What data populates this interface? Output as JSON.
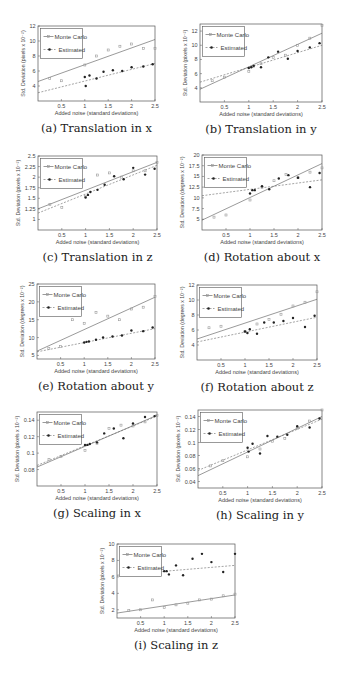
{
  "figure": {
    "legend": {
      "monte_carlo": "Monte Carlo",
      "estimated": "Estimated"
    },
    "xlabel": "Added noise (standard deviations)",
    "colors": {
      "axis": "#555555",
      "monte_carlo": "#9a9a9a",
      "estimated": "#222222",
      "background": "#ffffff"
    }
  },
  "chart_data": [
    {
      "id": "a",
      "caption": "(a) Translation in x",
      "type": "scatter",
      "xlabel": "Added noise (standard deviations)",
      "ylabel": "Std. Deviation (pixels x 10^-2)",
      "xlim": [
        0,
        2.5
      ],
      "ylim": [
        2,
        12
      ],
      "xticks": [
        0.5,
        1,
        1.5,
        2,
        2.5
      ],
      "xticklabels": [
        "0.5",
        "1",
        "1.5",
        "2",
        "2.5"
      ],
      "yticks": [
        4,
        6,
        8,
        10,
        12
      ],
      "yticklabels": [
        "4",
        "6",
        "8",
        "10",
        "12"
      ],
      "frame": {
        "x": 38,
        "y": 26,
        "w": 117,
        "h": 75
      },
      "series": [
        {
          "name": "Monte Carlo",
          "x": [
            0.25,
            0.5,
            1.0,
            1.25,
            1.5,
            1.75,
            2.0,
            2.25,
            2.5
          ],
          "y": [
            5.0,
            4.7,
            6.8,
            8.0,
            8.8,
            9.3,
            9.6,
            9.0,
            9.0
          ],
          "fit": [
            4.6,
            10.2
          ]
        },
        {
          "name": "Estimated",
          "x": [
            1.0,
            1.02,
            1.1,
            1.25,
            1.4,
            1.6,
            1.8,
            2.0,
            2.25,
            2.45
          ],
          "y": [
            5.2,
            4.0,
            5.4,
            5.0,
            5.9,
            6.1,
            6.0,
            6.5,
            6.6,
            6.9
          ],
          "fit": [
            3.1,
            7.0
          ]
        }
      ]
    },
    {
      "id": "b",
      "caption": "(b) Translation in y",
      "type": "scatter",
      "xlabel": "Added noise (standard deviations)",
      "ylabel": "Std. Deviation (pixels x 10^-2)",
      "xlim": [
        0,
        2.5
      ],
      "ylim": [
        2,
        13
      ],
      "xticks": [
        0.5,
        1,
        1.5,
        2,
        2.5
      ],
      "xticklabels": [
        "0.5",
        "1",
        "1.5",
        "2",
        "2.5"
      ],
      "yticks": [
        4,
        6,
        8,
        10,
        12
      ],
      "yticklabels": [
        "4",
        "6",
        "8",
        "10",
        "12"
      ],
      "frame": {
        "x": 200,
        "y": 24,
        "w": 122,
        "h": 78
      },
      "series": [
        {
          "name": "Monte Carlo",
          "x": [
            0.25,
            0.5,
            1.0,
            1.1,
            1.25,
            1.5,
            1.75,
            2.0,
            2.25,
            2.5
          ],
          "y": [
            5.0,
            5.5,
            6.3,
            7.0,
            7.4,
            8.3,
            8.6,
            10.0,
            11.0,
            12.8
          ],
          "fit": [
            3.8,
            11.7
          ]
        },
        {
          "name": "Estimated",
          "x": [
            1.0,
            1.05,
            1.1,
            1.25,
            1.4,
            1.6,
            1.8,
            2.0,
            2.25,
            2.45
          ],
          "y": [
            6.8,
            6.9,
            7.1,
            6.9,
            8.3,
            9.1,
            8.1,
            9.2,
            9.7,
            10.3
          ],
          "fit": [
            4.8,
            10.0
          ]
        }
      ]
    },
    {
      "id": "c",
      "caption": "(c) Translation in z",
      "type": "scatter",
      "xlabel": "Added noise (standard deviations)",
      "ylabel": "Std. Deviation (pixels x 10^-2)",
      "xlim": [
        0,
        2.5
      ],
      "ylim": [
        0.75,
        2.5
      ],
      "xticks": [
        0.5,
        1,
        1.5,
        2,
        2.5
      ],
      "xticklabels": [
        "0.5",
        "1",
        "1.5",
        "2",
        "2.5"
      ],
      "yticks": [
        1,
        1.25,
        1.5,
        1.75,
        2,
        2.25,
        2.5
      ],
      "yticklabels": [
        "1",
        "1.25",
        "1.5",
        "1.75",
        "2",
        "2.25",
        "2.5"
      ],
      "frame": {
        "x": 38,
        "y": 156,
        "w": 119,
        "h": 74
      },
      "series": [
        {
          "name": "Monte Carlo",
          "x": [
            0.25,
            0.5,
            1.0,
            1.25,
            1.5,
            1.75,
            2.0,
            2.25,
            2.5
          ],
          "y": [
            1.35,
            1.28,
            1.55,
            2.05,
            2.1,
            2.0,
            2.15,
            2.15,
            2.35
          ],
          "fit": [
            1.25,
            2.35
          ]
        },
        {
          "name": "Estimated",
          "x": [
            1.0,
            1.05,
            1.1,
            1.25,
            1.4,
            1.6,
            1.8,
            2.0,
            2.25,
            2.45
          ],
          "y": [
            1.52,
            1.58,
            1.65,
            1.7,
            1.82,
            2.02,
            1.95,
            2.22,
            2.06,
            2.2
          ],
          "fit": [
            1.15,
            2.28
          ]
        }
      ]
    },
    {
      "id": "d",
      "caption": "(d) Rotation about x",
      "type": "scatter",
      "xlabel": "Added noise (standard deviations)",
      "ylabel": "Std. Deviation (degrees x 10^-2)",
      "xlim": [
        0,
        2.5
      ],
      "ylim": [
        2.5,
        20
      ],
      "xticks": [
        0.5,
        1,
        1.5,
        2,
        2.5
      ],
      "xticklabels": [
        "0.5",
        "1",
        "1.5",
        "2",
        "2.5"
      ],
      "yticks": [
        5,
        7.5,
        10,
        12.5,
        15,
        17.5,
        20
      ],
      "yticklabels": [
        "5",
        "7.5",
        "10",
        "12.5",
        "15",
        "17.5",
        "20"
      ],
      "frame": {
        "x": 202,
        "y": 155,
        "w": 120,
        "h": 75
      },
      "series": [
        {
          "name": "Monte Carlo",
          "x": [
            0.25,
            0.5,
            1.0,
            1.25,
            1.5,
            1.75,
            2.0,
            2.25,
            2.5
          ],
          "y": [
            5.5,
            6.0,
            9.5,
            12.5,
            14.0,
            15.5,
            14.7,
            16.0,
            17.0
          ],
          "fit": [
            4.8,
            18.0
          ]
        },
        {
          "name": "Estimated",
          "x": [
            1.0,
            1.05,
            1.1,
            1.25,
            1.4,
            1.6,
            1.8,
            2.0,
            2.25,
            2.45
          ],
          "y": [
            11.0,
            11.8,
            11.8,
            12.7,
            12.0,
            14.5,
            15.3,
            14.7,
            12.5,
            15.8
          ],
          "fit": [
            10.5,
            14.2
          ]
        }
      ]
    },
    {
      "id": "e",
      "caption": "(e) Rotation about y",
      "type": "scatter",
      "xlabel": "Added noise (standard deviations)",
      "ylabel": "Std. Deviation (degrees x 10^-2)",
      "xlim": [
        0,
        2.5
      ],
      "ylim": [
        4,
        25
      ],
      "xticks": [
        0.5,
        1,
        1.5,
        2,
        2.5
      ],
      "xticklabels": [
        "0.5",
        "1",
        "1.5",
        "2",
        "2.5"
      ],
      "yticks": [
        5,
        10,
        15,
        20,
        25
      ],
      "yticklabels": [
        "5",
        "10",
        "15",
        "20",
        "25"
      ],
      "frame": {
        "x": 37,
        "y": 284,
        "w": 118,
        "h": 75
      },
      "series": [
        {
          "name": "Monte Carlo",
          "x": [
            0.25,
            0.5,
            0.75,
            1.0,
            1.25,
            1.5,
            1.75,
            2.0,
            2.25,
            2.5
          ],
          "y": [
            7.0,
            7.5,
            15.0,
            14.0,
            17.0,
            16.0,
            15.0,
            18.0,
            18.5,
            21.5
          ],
          "fit": [
            6.2,
            21.3
          ]
        },
        {
          "name": "Estimated",
          "x": [
            1.0,
            1.05,
            1.1,
            1.25,
            1.4,
            1.6,
            1.8,
            2.0,
            2.25,
            2.45
          ],
          "y": [
            8.6,
            8.8,
            8.9,
            9.4,
            10.0,
            10.3,
            10.6,
            12.0,
            11.8,
            12.8
          ],
          "fit": [
            6.0,
            12.5
          ]
        }
      ]
    },
    {
      "id": "f",
      "caption": "(f) Rotation about z",
      "type": "scatter",
      "xlabel": "Added noise (standard deviations)",
      "ylabel": "Std. Deviation (degrees x 10^-2)",
      "xlim": [
        0,
        2.5
      ],
      "ylim": [
        2,
        12
      ],
      "xticks": [
        0.5,
        1,
        1.5,
        2,
        2.5
      ],
      "xticklabels": [
        "0.5",
        "1",
        "1.5",
        "2",
        "2.5"
      ],
      "yticks": [
        4,
        6,
        8,
        10,
        12
      ],
      "yticklabels": [
        "4",
        "6",
        "8",
        "10",
        "12"
      ],
      "frame": {
        "x": 197,
        "y": 285,
        "w": 120,
        "h": 75
      },
      "series": [
        {
          "name": "Monte Carlo",
          "x": [
            0.25,
            0.5,
            0.75,
            1.0,
            1.25,
            1.5,
            1.75,
            2.0,
            2.25,
            2.5
          ],
          "y": [
            6.3,
            6.5,
            8.1,
            5.8,
            6.8,
            7.4,
            8.1,
            9.2,
            9.7,
            11.1
          ],
          "fit": [
            4.8,
            10.1
          ]
        },
        {
          "name": "Estimated",
          "x": [
            1.0,
            1.05,
            1.1,
            1.25,
            1.4,
            1.6,
            1.8,
            2.0,
            2.25,
            2.45
          ],
          "y": [
            5.8,
            5.6,
            6.1,
            5.5,
            7.0,
            7.0,
            7.2,
            7.6,
            6.4,
            7.9
          ],
          "fit": [
            4.4,
            7.7
          ]
        }
      ]
    },
    {
      "id": "g",
      "caption": "(g) Scaling in x",
      "type": "scatter",
      "xlabel": "Added noise (standard deviations)",
      "ylabel": "Std. Deviation (pixels x 10^-2)",
      "xlim": [
        0,
        2.5
      ],
      "ylim": [
        0.06,
        0.15
      ],
      "xticks": [
        0.5,
        1,
        1.5,
        2,
        2.5
      ],
      "xticklabels": [
        "0.5",
        "1",
        "1.5",
        "2",
        "2.5"
      ],
      "yticks": [
        0.08,
        0.1,
        0.12,
        0.14
      ],
      "yticklabels": [
        "0.08",
        "0.1",
        "0.12",
        "0.14"
      ],
      "frame": {
        "x": 37,
        "y": 412,
        "w": 120,
        "h": 74
      },
      "series": [
        {
          "name": "Monte Carlo",
          "x": [
            0.25,
            0.5,
            1.0,
            1.25,
            1.5,
            1.75,
            2.0,
            2.25,
            2.5
          ],
          "y": [
            0.092,
            0.096,
            0.103,
            0.112,
            0.13,
            0.134,
            0.133,
            0.138,
            0.146
          ],
          "fit": [
            0.083,
            0.146
          ]
        },
        {
          "name": "Estimated",
          "x": [
            1.0,
            1.05,
            1.1,
            1.25,
            1.4,
            1.6,
            1.8,
            2.0,
            2.25,
            2.45
          ],
          "y": [
            0.11,
            0.11,
            0.111,
            0.113,
            0.124,
            0.13,
            0.118,
            0.136,
            0.144,
            0.145
          ],
          "fit": [
            0.085,
            0.145
          ]
        }
      ]
    },
    {
      "id": "h",
      "caption": "(h) Scaling in y",
      "type": "scatter",
      "xlabel": "Added noise (standard deviations)",
      "ylabel": "Std. Deviation (pixels x 10^-2)",
      "xlim": [
        0,
        2.5
      ],
      "ylim": [
        0.03,
        0.15
      ],
      "xticks": [
        0.5,
        1,
        1.5,
        2,
        2.5
      ],
      "xticklabels": [
        "0.5",
        "1",
        "1.5",
        "2",
        "2.5"
      ],
      "yticks": [
        0.04,
        0.06,
        0.08,
        0.1,
        0.12,
        0.14
      ],
      "yticklabels": [
        "0.04",
        "0.06",
        "0.08",
        "0.1",
        "0.12",
        "0.14"
      ],
      "frame": {
        "x": 198,
        "y": 410,
        "w": 124,
        "h": 78
      },
      "series": [
        {
          "name": "Monte Carlo",
          "x": [
            0.25,
            0.5,
            0.75,
            1.0,
            1.25,
            1.5,
            1.75,
            2.0,
            2.25,
            2.5
          ],
          "y": [
            0.064,
            0.072,
            0.119,
            0.078,
            0.09,
            0.102,
            0.106,
            0.122,
            0.133,
            0.15
          ],
          "fit": [
            0.049,
            0.14
          ]
        },
        {
          "name": "Estimated",
          "x": [
            1.0,
            1.02,
            1.1,
            1.25,
            1.4,
            1.6,
            1.8,
            2.0,
            2.25,
            2.45
          ],
          "y": [
            0.092,
            0.086,
            0.098,
            0.083,
            0.11,
            0.109,
            0.112,
            0.125,
            0.123,
            0.137
          ],
          "fit": [
            0.057,
            0.136
          ]
        }
      ]
    },
    {
      "id": "i",
      "caption": "(i) Scaling in z",
      "type": "scatter",
      "xlabel": "Added noise (standard deviations)",
      "ylabel": "Std. Deviation (pixels x 10^-2)",
      "xlim": [
        0,
        2.5
      ],
      "ylim": [
        1,
        10
      ],
      "xticks": [
        0.5,
        1,
        1.5,
        2,
        2.5
      ],
      "xticklabels": [
        "0.5",
        "1",
        "1.5",
        "2",
        "2.5"
      ],
      "yticks": [
        2,
        4,
        6,
        8,
        10
      ],
      "yticklabels": [
        "2",
        "4",
        "6",
        "8",
        "10"
      ],
      "frame": {
        "x": 117,
        "y": 544,
        "w": 118,
        "h": 74
      },
      "series": [
        {
          "name": "Monte Carlo",
          "x": [
            0.25,
            0.5,
            0.75,
            1.0,
            1.25,
            1.5,
            1.75,
            2.0,
            2.25,
            2.5
          ],
          "y": [
            1.9,
            2.0,
            3.2,
            2.3,
            2.6,
            2.8,
            3.2,
            3.3,
            3.7,
            3.9
          ],
          "fit": [
            1.6,
            3.8
          ]
        },
        {
          "name": "Estimated",
          "x": [
            1.0,
            1.05,
            1.1,
            1.25,
            1.4,
            1.6,
            1.8,
            2.0,
            2.25,
            2.5
          ],
          "y": [
            6.7,
            6.7,
            6.3,
            7.4,
            6.2,
            8.2,
            8.8,
            7.8,
            6.6,
            8.8
          ],
          "fit": [
            6.2,
            7.4
          ]
        }
      ]
    }
  ]
}
